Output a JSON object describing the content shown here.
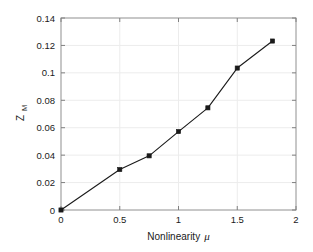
{
  "chart_data": {
    "type": "line",
    "title": "",
    "xlabel": "Nonlinearity μ",
    "ylabel": "Z_M",
    "ylabel_base": "Z",
    "ylabel_sub": "M",
    "xlabel_text": "Nonlinearity",
    "xlabel_symbol": "μ",
    "xlim": [
      0,
      2
    ],
    "ylim": [
      0,
      0.14
    ],
    "xticks": [
      0,
      0.5,
      1,
      1.5,
      2
    ],
    "xtick_labels": [
      "0",
      "0.5",
      "1",
      "1.5",
      "2"
    ],
    "yticks": [
      0,
      0.02,
      0.04,
      0.06,
      0.08,
      0.1,
      0.12,
      0.14
    ],
    "ytick_labels": [
      "0",
      "0.02",
      "0.04",
      "0.06",
      "0.08",
      "0.1",
      "0.12",
      "0.14"
    ],
    "grid": true,
    "legend": null,
    "series": [
      {
        "name": "Z_M vs Nonlinearity",
        "marker": "square",
        "line_color": "#1a1a1a",
        "marker_color": "#1a1a1a",
        "x": [
          0,
          0.5,
          0.75,
          1.0,
          1.25,
          1.5,
          1.8
        ],
        "values": [
          0.0,
          0.0295,
          0.0395,
          0.0572,
          0.0745,
          0.1035,
          0.1232
        ]
      }
    ]
  },
  "style": {
    "background": "#ffffff",
    "axis_color": "#808080",
    "grid_color": "#ececec",
    "text_color": "#1a1a1a",
    "line_color": "#1a1a1a"
  }
}
